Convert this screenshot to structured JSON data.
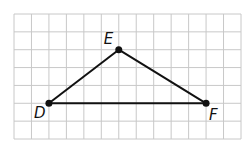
{
  "diagram": {
    "type": "triangle-on-grid",
    "grid": {
      "columns": 13,
      "rows": 7,
      "line_color": "#c8c8c8"
    },
    "points": [
      {
        "label": "D",
        "col": 2,
        "row": 5
      },
      {
        "label": "E",
        "col": 6,
        "row": 2
      },
      {
        "label": "F",
        "col": 11,
        "row": 5
      }
    ],
    "segments": [
      [
        "D",
        "E"
      ],
      [
        "E",
        "F"
      ],
      [
        "D",
        "F"
      ]
    ],
    "stroke_color": "#111111"
  }
}
